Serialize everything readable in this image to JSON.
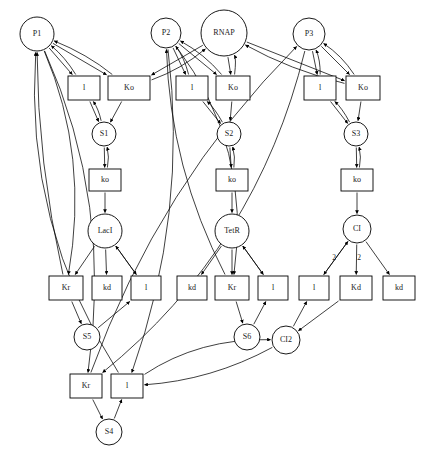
{
  "diagram": {
    "type": "petri-net-biochemical-network",
    "width": 423,
    "height": 453,
    "colors": {
      "stroke": "#000000",
      "fill": "#ffffff",
      "text": "#222222"
    },
    "places": [
      {
        "id": "P1",
        "label": "P1",
        "cx": 37,
        "cy": 34,
        "r": 17
      },
      {
        "id": "P2",
        "label": "P2",
        "cx": 166,
        "cy": 33,
        "r": 15
      },
      {
        "id": "RNAP",
        "label": "RNAP",
        "cx": 224,
        "cy": 33,
        "r": 23
      },
      {
        "id": "P3",
        "label": "P3",
        "cx": 309,
        "cy": 34,
        "r": 16
      },
      {
        "id": "S1",
        "label": "S1",
        "cx": 104,
        "cy": 134,
        "r": 12
      },
      {
        "id": "S2",
        "label": "S2",
        "cx": 229,
        "cy": 134,
        "r": 12
      },
      {
        "id": "S3",
        "label": "S3",
        "cx": 356,
        "cy": 134,
        "r": 12
      },
      {
        "id": "LacI",
        "label": "LacI",
        "cx": 105,
        "cy": 231,
        "r": 17
      },
      {
        "id": "TetR",
        "label": "TetR",
        "cx": 232,
        "cy": 231,
        "r": 17
      },
      {
        "id": "CI",
        "label": "CI",
        "cx": 357,
        "cy": 229,
        "r": 14
      },
      {
        "id": "S5",
        "label": "S5",
        "cx": 87,
        "cy": 337,
        "r": 13
      },
      {
        "id": "S6",
        "label": "S6",
        "cx": 247,
        "cy": 337,
        "r": 13
      },
      {
        "id": "CI2",
        "label": "CI2",
        "cx": 286,
        "cy": 340,
        "r": 14
      },
      {
        "id": "S4",
        "label": "S4",
        "cx": 109,
        "cy": 432,
        "r": 13
      }
    ],
    "transitions": [
      {
        "id": "t_l1",
        "label": "l",
        "x": 68,
        "y": 76,
        "w": 32,
        "h": 24
      },
      {
        "id": "t_Ko1",
        "label": "Ko",
        "x": 108,
        "y": 76,
        "w": 42,
        "h": 24
      },
      {
        "id": "t_l2",
        "label": "l",
        "x": 176,
        "y": 76,
        "w": 32,
        "h": 24
      },
      {
        "id": "t_Ko2",
        "label": "Ko",
        "x": 216,
        "y": 76,
        "w": 34,
        "h": 24
      },
      {
        "id": "t_l3",
        "label": "l",
        "x": 304,
        "y": 76,
        "w": 32,
        "h": 24
      },
      {
        "id": "t_Ko3",
        "label": "Ko",
        "x": 346,
        "y": 76,
        "w": 34,
        "h": 24
      },
      {
        "id": "t_ko1",
        "label": "ko",
        "x": 89,
        "y": 169,
        "w": 32,
        "h": 22
      },
      {
        "id": "t_ko2",
        "label": "ko",
        "x": 216,
        "y": 169,
        "w": 32,
        "h": 22
      },
      {
        "id": "t_ko3",
        "label": "ko",
        "x": 341,
        "y": 169,
        "w": 32,
        "h": 22
      },
      {
        "id": "t_Kr1",
        "label": "Kr",
        "x": 49,
        "y": 276,
        "w": 34,
        "h": 24
      },
      {
        "id": "t_kd1",
        "label": "kd",
        "x": 92,
        "y": 276,
        "w": 30,
        "h": 24
      },
      {
        "id": "t_l4",
        "label": "l",
        "x": 131,
        "y": 276,
        "w": 30,
        "h": 24
      },
      {
        "id": "t_kd2",
        "label": "kd",
        "x": 177,
        "y": 276,
        "w": 30,
        "h": 24
      },
      {
        "id": "t_Kr2",
        "label": "Kr",
        "x": 215,
        "y": 276,
        "w": 34,
        "h": 24
      },
      {
        "id": "t_l5",
        "label": "l",
        "x": 258,
        "y": 276,
        "w": 30,
        "h": 24
      },
      {
        "id": "t_l6",
        "label": "l",
        "x": 299,
        "y": 276,
        "w": 30,
        "h": 24
      },
      {
        "id": "t_Kd1",
        "label": "Kd",
        "x": 340,
        "y": 276,
        "w": 32,
        "h": 24
      },
      {
        "id": "t_kd3",
        "label": "kd",
        "x": 383,
        "y": 276,
        "w": 32,
        "h": 24
      },
      {
        "id": "t_Kr3",
        "label": "Kr",
        "x": 70,
        "y": 374,
        "w": 32,
        "h": 24
      },
      {
        "id": "t_l7",
        "label": "l",
        "x": 111,
        "y": 374,
        "w": 32,
        "h": 24
      }
    ],
    "edge_labels": [
      {
        "id": "mult_l6",
        "text": "2",
        "x": 334,
        "y": 258
      },
      {
        "id": "mult_Kd1",
        "text": "2",
        "x": 359,
        "y": 258
      }
    ]
  }
}
